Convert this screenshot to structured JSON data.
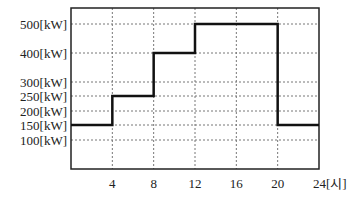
{
  "chart_data": {
    "type": "line",
    "subtype": "step",
    "title": "",
    "xlabel": "[시]",
    "ylabel": "[kW]",
    "x_ticks": [
      "4",
      "8",
      "12",
      "16",
      "20",
      "24[시]"
    ],
    "y_ticks": [
      "500[kW]",
      "400[kW]",
      "300[kW]",
      "250[kW]",
      "200[kW]",
      "150[kW]",
      "100[kW]"
    ],
    "y_tick_values": [
      500,
      400,
      300,
      250,
      200,
      150,
      100
    ],
    "xlim": [
      0,
      24
    ],
    "grid": true,
    "grid_style": "dotted",
    "series": [
      {
        "name": "load",
        "segments": [
          {
            "x_start": 0,
            "x_end": 4,
            "value": 150
          },
          {
            "x_start": 4,
            "x_end": 8,
            "value": 250
          },
          {
            "x_start": 8,
            "x_end": 12,
            "value": 400
          },
          {
            "x_start": 12,
            "x_end": 20,
            "value": 500
          },
          {
            "x_start": 20,
            "x_end": 24,
            "value": 150
          }
        ]
      }
    ]
  },
  "colors": {
    "line": "#111111",
    "grid": "#777777",
    "frame": "#222222"
  }
}
